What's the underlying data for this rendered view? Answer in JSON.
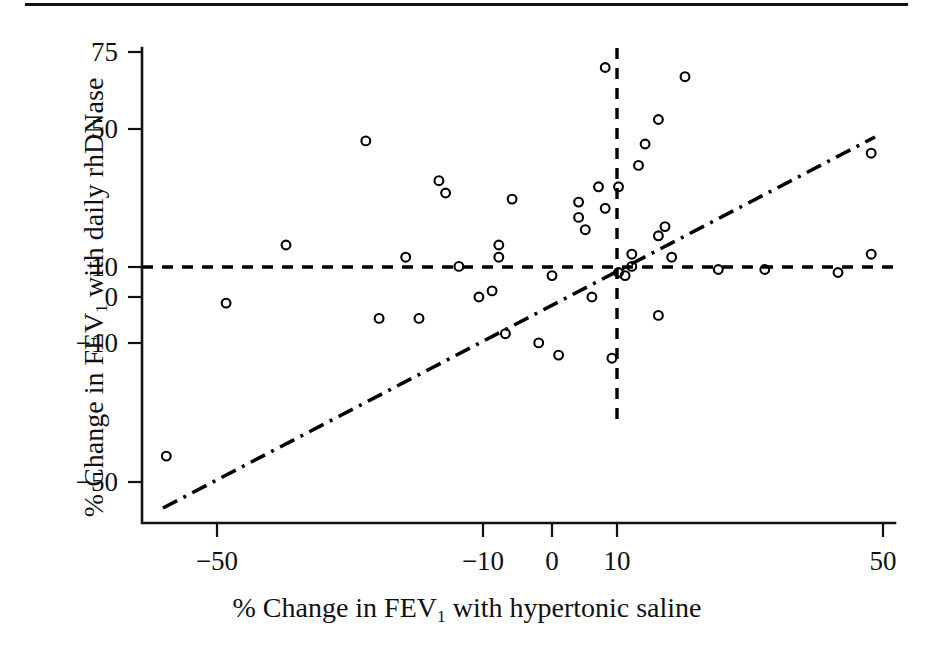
{
  "figure": {
    "has_top_rule": true,
    "background_color": "#ffffff",
    "ink_color": "#000000"
  },
  "chart_data": {
    "type": "scatter",
    "title": "",
    "xlabel_parts": {
      "pre": "% Change in FEV",
      "sub": "1",
      "post": " with hypertonic saline"
    },
    "ylabel_parts": {
      "pre": "% Change in FEV",
      "sub": "1",
      "post": " with daily rhDNase"
    },
    "xlabel": "% Change in FEV1 with hypertonic saline",
    "ylabel": "% Change in FEV1 with daily rhDNase",
    "xlim": [
      -62,
      54
    ],
    "ylim": [
      -58,
      80
    ],
    "xticks": [
      -50,
      -10,
      0,
      10,
      50
    ],
    "xticklabels": [
      "−50",
      "−10",
      "0",
      "10",
      "50"
    ],
    "yticks": [
      75,
      50,
      10,
      0,
      -10,
      -50
    ],
    "yticklabels": [
      "75",
      "50",
      "10",
      "0",
      "−10",
      "−50"
    ],
    "grid": false,
    "legend": null,
    "marker": "open-circle",
    "points": [
      [
        -58,
        -52
      ],
      [
        -49,
        -2
      ],
      [
        -40,
        17
      ],
      [
        -28,
        51
      ],
      [
        -26,
        -7
      ],
      [
        -22,
        13
      ],
      [
        -20,
        -7
      ],
      [
        -17,
        38
      ],
      [
        -16,
        34
      ],
      [
        -14,
        10
      ],
      [
        -11,
        0
      ],
      [
        -9,
        2
      ],
      [
        -8,
        17
      ],
      [
        -8,
        13
      ],
      [
        -7,
        -12
      ],
      [
        -6,
        32
      ],
      [
        -2,
        -15
      ],
      [
        1,
        -19
      ],
      [
        0,
        7
      ],
      [
        4,
        31
      ],
      [
        4,
        26
      ],
      [
        5,
        22
      ],
      [
        6,
        0
      ],
      [
        7,
        36
      ],
      [
        8,
        75
      ],
      [
        8,
        29
      ],
      [
        9,
        -20
      ],
      [
        10,
        36
      ],
      [
        10,
        8
      ],
      [
        11,
        7
      ],
      [
        12,
        14
      ],
      [
        12,
        10
      ],
      [
        13,
        43
      ],
      [
        14,
        50
      ],
      [
        16,
        58
      ],
      [
        16,
        20
      ],
      [
        16,
        -6
      ],
      [
        17,
        23
      ],
      [
        18,
        13
      ],
      [
        20,
        72
      ],
      [
        25,
        9
      ],
      [
        32,
        9
      ],
      [
        43,
        8
      ],
      [
        48,
        47
      ],
      [
        48,
        14
      ]
    ],
    "reference_lines": [
      {
        "name": "horizontal-10-percent",
        "orientation": "horizontal",
        "value": 10,
        "style": "dashed"
      },
      {
        "name": "vertical-10-percent",
        "orientation": "vertical",
        "value": 10,
        "style": "dashed"
      }
    ],
    "fit_line": {
      "name": "regression-line",
      "style": "dash-dot",
      "x_start": -59,
      "y_start": -55,
      "x_end": 48,
      "y_end": 48
    }
  }
}
